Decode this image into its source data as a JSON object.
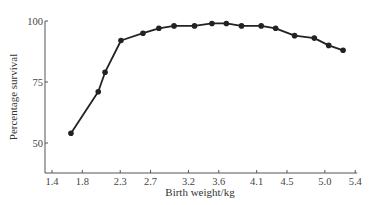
{
  "chart_data": {
    "type": "line",
    "title": "",
    "xlabel": "Birth weight/kg",
    "ylabel": "Percentage survival",
    "xlim": [
      1.4,
      5.4
    ],
    "ylim": [
      37.7,
      100
    ],
    "xticks": [
      1.4,
      1.8,
      2.3,
      2.7,
      3.2,
      3.6,
      4.1,
      4.5,
      5.0,
      5.4
    ],
    "xtick_labels": [
      "1.4",
      "1.8",
      "2.3",
      "2.7",
      "3.2",
      "3.6",
      "4.1",
      "4.5",
      "5.0",
      "5.4"
    ],
    "yticks": [
      50,
      75,
      100
    ],
    "ytick_labels": [
      "50",
      "75",
      "100"
    ],
    "grid": false,
    "legend": null,
    "series": [
      {
        "name": "Percentage survival",
        "x": [
          1.65,
          2.01,
          2.1,
          2.31,
          2.6,
          2.81,
          3.01,
          3.28,
          3.51,
          3.7,
          3.9,
          4.16,
          4.35,
          4.6,
          4.86,
          5.05,
          5.24
        ],
        "y": [
          54,
          71,
          79,
          92,
          95,
          97,
          98,
          98,
          99,
          99,
          98,
          98,
          97,
          94,
          93,
          90,
          88
        ],
        "color": "#222222",
        "marker": "circle"
      }
    ]
  },
  "colors": {
    "line": "#222222",
    "axis": "#555555",
    "text": "#333333"
  }
}
